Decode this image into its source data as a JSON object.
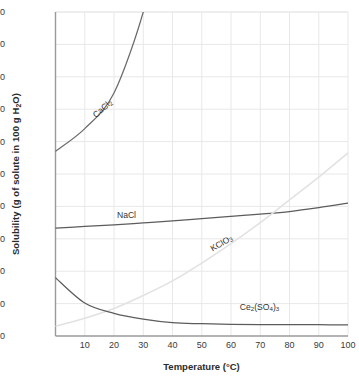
{
  "chart_data": {
    "type": "line",
    "title": "",
    "xlabel": "Temperature (°C)",
    "ylabel": "Solubility (g of solute in 100 g H₂O)",
    "xlim": [
      0,
      100
    ],
    "ylim": [
      0,
      100
    ],
    "grid": true,
    "legend_position": "inline-labels",
    "xticks": [
      10,
      20,
      30,
      40,
      50,
      60,
      70,
      80,
      90,
      100
    ],
    "yticks": [
      0,
      10,
      20,
      30,
      40,
      50,
      60,
      70,
      80,
      90,
      100
    ],
    "x": [
      0,
      10,
      20,
      30,
      40,
      50,
      60,
      70,
      80,
      90,
      100
    ],
    "series": [
      {
        "name": "CaCl2",
        "label_html": "CaCl<sub>2</sub>",
        "color": "#6b6b6b",
        "values": [
          57,
          64,
          75,
          100,
          null,
          null,
          null,
          null,
          null,
          null,
          null
        ],
        "note": "rises steeply off the top of the plot near 27 °C"
      },
      {
        "name": "NaCl",
        "label_html": "NaCl",
        "color": "#5c5c5c",
        "values": [
          33.3,
          33.8,
          34.3,
          34.9,
          35.5,
          36.2,
          36.9,
          37.6,
          38.4,
          39.6,
          41.0
        ]
      },
      {
        "name": "KClO3",
        "label_html": "KClO<sub>3</sub>",
        "color": "#e2e2e2",
        "values": [
          3,
          5.5,
          8.5,
          12.5,
          17,
          22.5,
          28.5,
          35,
          42,
          49,
          56.5
        ]
      },
      {
        "name": "Ce2(SO4)3",
        "label_html": "Ce<sub>2</sub>(SO<sub>4</sub>)<sub>3</sub>",
        "color": "#5c5c5c",
        "values": [
          18,
          10.2,
          7.0,
          5.2,
          4.1,
          3.8,
          3.6,
          3.5,
          3.5,
          3.5,
          3.4
        ]
      }
    ],
    "series_labels": [
      {
        "name": "CaCl2",
        "text_at": {
          "x": 13,
          "y": 68
        },
        "rotation": -42
      },
      {
        "name": "NaCl",
        "text_at": {
          "x": 21,
          "y": 37.5
        },
        "rotation": 0
      },
      {
        "name": "KClO3",
        "text_at": {
          "x": 53,
          "y": 27
        },
        "rotation": -30
      },
      {
        "name": "Ce2(SO4)3",
        "text_at": {
          "x": 63,
          "y": 9
        },
        "rotation": 0
      }
    ]
  },
  "axes": {
    "x_title": "Temperature (°C)",
    "y_title": "Solubility (g of solute in 100 g H₂O)",
    "x_labels": [
      "10",
      "20",
      "30",
      "40",
      "50",
      "60",
      "70",
      "80",
      "90",
      "100"
    ],
    "y_labels": [
      "0",
      "10",
      "20",
      "30",
      "40",
      "50",
      "60",
      "70",
      "80",
      "90",
      "100"
    ]
  },
  "colors": {
    "grid": "#e8e8e8",
    "axis": "#9a9a9a",
    "curve_dark": "#5c5c5c",
    "curve_faint": "#e2e2e2",
    "text": "#333333"
  }
}
